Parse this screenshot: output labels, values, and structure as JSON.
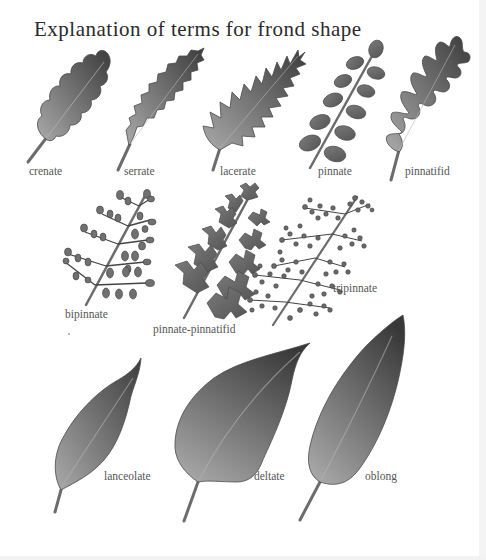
{
  "page": {
    "title": "Explanation of terms for frond shape",
    "colors": {
      "background": "#ffffff",
      "title_text": "#2a2a2a",
      "label_text": "#555555",
      "leaf_dark": "#3a3a3a",
      "leaf_light": "#a8a8a8",
      "outline": "#4a4a4a"
    }
  },
  "fronds": [
    {
      "term": "crenate",
      "icon": "crenate-leaf-icon"
    },
    {
      "term": "serrate",
      "icon": "serrate-leaf-icon"
    },
    {
      "term": "lacerate",
      "icon": "lacerate-leaf-icon"
    },
    {
      "term": "pinnate",
      "icon": "pinnate-frond-icon"
    },
    {
      "term": "pinnatifid",
      "icon": "pinnatifid-leaf-icon"
    },
    {
      "term": "bipinnate",
      "icon": "bipinnate-frond-icon"
    },
    {
      "term": "pinnate-pinnatifid",
      "icon": "pinnate-pinnatifid-frond-icon"
    },
    {
      "term": "tripinnate",
      "icon": "tripinnate-frond-icon"
    },
    {
      "term": "lanceolate",
      "icon": "lanceolate-leaf-icon"
    },
    {
      "term": "deltate",
      "icon": "deltate-leaf-icon"
    },
    {
      "term": "oblong",
      "icon": "oblong-leaf-icon"
    }
  ]
}
